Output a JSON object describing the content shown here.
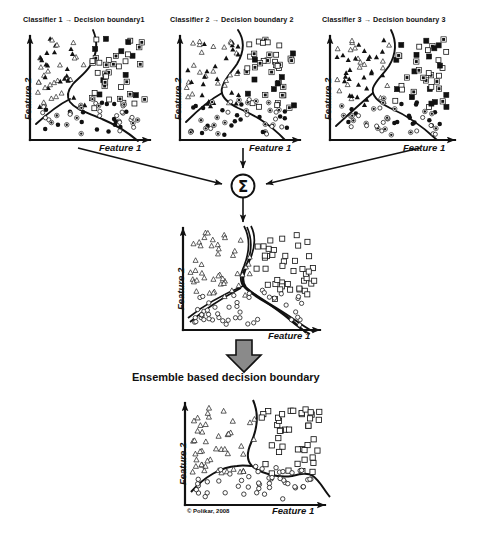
{
  "figure": {
    "copyright": "© Polikar, 2008",
    "ensemble_caption": "Ensemble based decision boundary",
    "combiner_symbol": "Σ",
    "axis": {
      "x_label": "Feature 1",
      "y_label": "Feature 2"
    },
    "colors": {
      "ink": "#111111",
      "background": "#ffffff",
      "block_arrow_fill": "#8a8a8a",
      "marker_fill": "#111111",
      "marker_hollow": "#ffffff"
    },
    "panels": [
      {
        "id": "classifier-1",
        "title": "Classifier 1 → Decision  boundary1"
      },
      {
        "id": "classifier-2",
        "title": "Classifier 2 → Decision  boundary 2"
      },
      {
        "id": "classifier-3",
        "title": "Classifier 3 → Decision  boundary 3"
      },
      {
        "id": "combined",
        "title": ""
      },
      {
        "id": "ensemble",
        "title": ""
      }
    ]
  },
  "chart_data": {
    "type": "scatter",
    "title": "Ensemble based decision boundary",
    "xlabel": "Feature 1",
    "ylabel": "Feature 2",
    "xlim": [
      0,
      100
    ],
    "ylim": [
      0,
      100
    ],
    "grid": false,
    "legend": null,
    "classes": [
      {
        "name": "triangle-class",
        "marker": "triangle",
        "region": "upper-left"
      },
      {
        "name": "square-class",
        "marker": "square",
        "region": "upper-right"
      },
      {
        "name": "circle-class",
        "marker": "circle",
        "region": "lower"
      }
    ],
    "charts": [
      {
        "id": "classifier-1",
        "title": "Classifier 1 → Decision  boundary1",
        "boundary": "piecewise decision boundary splitting triangles (upper-left), squares (upper-right) and circles (lower)",
        "points": {
          "triangle_filled": [
            [
              10,
              82
            ],
            [
              17,
              85
            ],
            [
              24,
              86
            ],
            [
              31,
              84
            ],
            [
              8,
              73
            ],
            [
              15,
              74
            ],
            [
              22,
              75
            ],
            [
              29,
              72
            ],
            [
              36,
              76
            ],
            [
              6,
              64
            ],
            [
              13,
              66
            ],
            [
              20,
              63
            ],
            [
              27,
              67
            ],
            [
              34,
              64
            ],
            [
              41,
              68
            ],
            [
              11,
              55
            ],
            [
              18,
              57
            ],
            [
              25,
              54
            ],
            [
              32,
              58
            ],
            [
              39,
              56
            ],
            [
              46,
              60
            ],
            [
              9,
              46
            ],
            [
              16,
              48
            ],
            [
              23,
              45
            ],
            [
              30,
              49
            ],
            [
              37,
              47
            ],
            [
              7,
              36
            ],
            [
              14,
              38
            ],
            [
              21,
              35
            ],
            [
              28,
              39
            ],
            [
              5,
              26
            ],
            [
              12,
              28
            ],
            [
              19,
              25
            ]
          ],
          "triangle_hollow": [
            [
              36,
              92
            ],
            [
              13,
              80
            ],
            [
              27,
              79
            ],
            [
              20,
              70
            ],
            [
              34,
              71
            ],
            [
              41,
              62
            ],
            [
              24,
              60
            ],
            [
              16,
              52
            ],
            [
              30,
              51
            ],
            [
              43,
              53
            ],
            [
              11,
              42
            ],
            [
              18,
              41
            ],
            [
              25,
              43
            ],
            [
              9,
              31
            ],
            [
              15,
              30
            ],
            [
              22,
              33
            ]
          ],
          "square_filled": [
            [
              57,
              90
            ],
            [
              70,
              88
            ],
            [
              80,
              85
            ],
            [
              63,
              78
            ],
            [
              76,
              79
            ],
            [
              86,
              77
            ],
            [
              58,
              70
            ],
            [
              68,
              71
            ],
            [
              90,
              72
            ],
            [
              61,
              62
            ],
            [
              72,
              63
            ],
            [
              84,
              64
            ],
            [
              93,
              61
            ],
            [
              66,
              54
            ],
            [
              78,
              55
            ],
            [
              88,
              52
            ],
            [
              70,
              44
            ],
            [
              82,
              45
            ],
            [
              92,
              40
            ],
            [
              86,
              30
            ],
            [
              90,
              22
            ]
          ],
          "square_hollow": [
            [
              54,
              83
            ],
            [
              65,
              84
            ],
            [
              75,
              82
            ],
            [
              55,
              74
            ],
            [
              66,
              75
            ],
            [
              80,
              73
            ],
            [
              89,
              74
            ],
            [
              54,
              66
            ],
            [
              64,
              67
            ],
            [
              77,
              66
            ],
            [
              87,
              67
            ],
            [
              58,
              57
            ],
            [
              69,
              58
            ],
            [
              80,
              58
            ],
            [
              91,
              56
            ],
            [
              62,
              47
            ],
            [
              74,
              48
            ],
            [
              85,
              46
            ],
            [
              93,
              48
            ],
            [
              72,
              36
            ],
            [
              83,
              35
            ]
          ],
          "circle_filled": [
            [
              11,
              16
            ],
            [
              18,
              14
            ],
            [
              25,
              17
            ],
            [
              32,
              13
            ],
            [
              39,
              16
            ],
            [
              46,
              12
            ],
            [
              53,
              15
            ],
            [
              60,
              13
            ],
            [
              67,
              16
            ],
            [
              74,
              12
            ],
            [
              14,
              7
            ],
            [
              21,
              9
            ],
            [
              28,
              6
            ],
            [
              35,
              9
            ],
            [
              42,
              7
            ],
            [
              49,
              10
            ],
            [
              56,
              6
            ],
            [
              63,
              9
            ],
            [
              70,
              7
            ],
            [
              77,
              9
            ],
            [
              20,
              24
            ],
            [
              30,
              22
            ],
            [
              40,
              25
            ],
            [
              50,
              23
            ],
            [
              60,
              21
            ]
          ],
          "circle_hollow": [
            [
              24,
              30
            ],
            [
              34,
              31
            ],
            [
              44,
              29
            ],
            [
              54,
              30
            ],
            [
              64,
              28
            ],
            [
              72,
              24
            ],
            [
              80,
              18
            ],
            [
              84,
              12
            ],
            [
              28,
              14
            ],
            [
              44,
              11
            ],
            [
              58,
              11
            ],
            [
              68,
              11
            ],
            [
              76,
              14
            ],
            [
              48,
              19
            ],
            [
              36,
              19
            ]
          ]
        }
      },
      {
        "id": "classifier-2",
        "title": "Classifier 2 → Decision  boundary 2",
        "boundary": "different piecewise boundary, same three-region structure"
      },
      {
        "id": "classifier-3",
        "title": "Classifier 3 → Decision  boundary 3",
        "boundary": "third variant of piecewise boundary"
      },
      {
        "id": "combined",
        "title": "",
        "boundary": "all three decision boundaries overlaid"
      },
      {
        "id": "ensemble",
        "title": "Ensemble based decision boundary",
        "boundary": "single smooth combined decision boundary"
      }
    ]
  }
}
